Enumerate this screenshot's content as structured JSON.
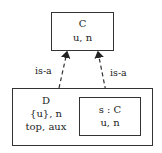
{
  "diagram": {
    "class_c": {
      "name": "C",
      "attrs": "u, n"
    },
    "class_d": {
      "name": "D",
      "attrs_line1": "{u}, n",
      "attrs_line2": "top, aux"
    },
    "part_s": {
      "name": "s : C",
      "attrs": "u, n"
    },
    "edges": [
      {
        "from": "D",
        "to": "C",
        "label": "is-a",
        "style": "dashed"
      },
      {
        "from": "s : C",
        "to": "C",
        "label": "is-a",
        "style": "dashed"
      }
    ],
    "colors": {
      "stroke": "#333333",
      "text": "#222222",
      "background": "#ffffff"
    }
  }
}
